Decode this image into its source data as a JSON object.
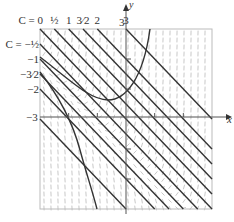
{
  "figure": {
    "x_axis_label": "x",
    "y_axis_label": "y",
    "x_left_label": "−3",
    "y_top_label": "3",
    "top_labels": [
      {
        "text": "C = 0",
        "x": -3
      },
      {
        "text": "½",
        "x": -2.5
      },
      {
        "text": "1",
        "x": -2
      },
      {
        "text": "3⁄2",
        "x": -1.5
      },
      {
        "text": "2",
        "x": -1
      },
      {
        "text": "3",
        "x": 0
      }
    ],
    "left_labels": [
      {
        "text": "C = −½",
        "y": 2.5
      },
      {
        "text": "−1",
        "y": 2
      },
      {
        "text": "−3⁄2",
        "y": 1.5
      },
      {
        "text": "−2",
        "y": 1
      }
    ],
    "colors": {
      "curve": "#333333",
      "axis": "#555555",
      "frame": "#bbbbbb",
      "field": "#b0b0b0"
    }
  },
  "chart_data": {
    "type": "line",
    "title": "",
    "xlabel": "x",
    "ylabel": "y",
    "xlim": [
      -3,
      3
    ],
    "ylim": [
      -3,
      3
    ],
    "grid": false,
    "annotations": [
      "C = 0",
      "1/2",
      "1",
      "3/2",
      "2",
      "3",
      "C = -1/2",
      "-1",
      "-3/2",
      "-2",
      "-3",
      "3"
    ],
    "straight_solutions": {
      "form": "y = -x + C",
      "C_values": [
        3,
        2,
        1.5,
        1,
        0.5,
        0,
        -0.5,
        -1,
        -1.5,
        -2,
        -3
      ]
    },
    "curved_solutions": [
      {
        "name": "U-shaped curve",
        "points": [
          [
            -3,
            2.15
          ],
          [
            -2,
            1.1
          ],
          [
            -1,
            0.2
          ],
          [
            -0.6,
            -0.05
          ],
          [
            0,
            0.95
          ],
          [
            0.5,
            2.2
          ],
          [
            0.82,
            3
          ]
        ]
      },
      {
        "name": "steep curve",
        "points": [
          [
            -3,
            1.55
          ],
          [
            -2.5,
            0.7
          ],
          [
            -2,
            0.0
          ],
          [
            -1.5,
            -1.3
          ],
          [
            -1.0,
            -3
          ]
        ]
      }
    ],
    "slope_field": {
      "spacing_px": 7
    }
  }
}
